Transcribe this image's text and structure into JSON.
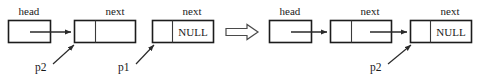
{
  "figure": {
    "type": "linked-list-pointer-diagram",
    "transition_symbol": "⟹",
    "panels": [
      {
        "id": "before",
        "nodes": [
          {
            "id": "head-node",
            "top_label": "head",
            "cells": [
              "",
              ""
            ],
            "single_cell": true
          },
          {
            "id": "node-1",
            "top_label": "next",
            "cells": [
              "",
              ""
            ],
            "single_cell": false
          },
          {
            "id": "node-2",
            "top_label": "next",
            "cells": [
              "",
              "NULL"
            ],
            "single_cell": false
          }
        ],
        "pointers": [
          {
            "label": "p2",
            "target": "node-1"
          },
          {
            "label": "p1",
            "target": "node-2"
          }
        ]
      },
      {
        "id": "after",
        "nodes": [
          {
            "id": "head-node",
            "top_label": "head",
            "cells": [
              "",
              ""
            ],
            "single_cell": true
          },
          {
            "id": "node-1",
            "top_label": "next",
            "cells": [
              "",
              ""
            ],
            "single_cell": false
          },
          {
            "id": "node-2",
            "top_label": "next",
            "cells": [
              "",
              "NULL"
            ],
            "single_cell": false
          }
        ],
        "pointers": [
          {
            "label": "p2",
            "target": "node-2"
          }
        ]
      }
    ],
    "colors": {
      "background": "#ffffff",
      "stroke": "#1c1c1c",
      "text": "#1a1a1a",
      "arrow": "#2a2a2a",
      "implies_stroke": "#4a4a4a"
    }
  }
}
